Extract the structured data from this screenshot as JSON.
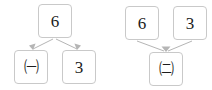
{
  "diagrams": [
    {
      "name": "decomposition",
      "direction": "top-to-bottom",
      "top": {
        "label": "6"
      },
      "children": [
        {
          "label": "㈠"
        },
        {
          "label": "3"
        }
      ]
    },
    {
      "name": "composition",
      "direction": "bottom-up",
      "parents": [
        {
          "label": "6"
        },
        {
          "label": "3"
        }
      ],
      "result": {
        "label": "㈡"
      }
    }
  ],
  "colors": {
    "box_border": "#c9c9c9",
    "box_fill": "#ffffff",
    "edge": "#b5b5b5",
    "text": "#1c1c1c",
    "background": "#ffffff"
  }
}
